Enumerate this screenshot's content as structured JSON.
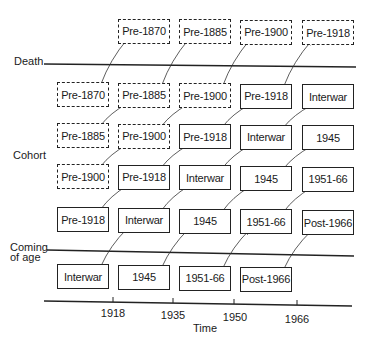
{
  "diagram": {
    "title": "",
    "labels": {
      "death": "Death",
      "cohort": "Cohort",
      "coming_of_age_line1": "Coming",
      "coming_of_age_line2": "of age",
      "time": "Time"
    },
    "axis_ticks": [
      "1918",
      "1935",
      "1950",
      "1966"
    ],
    "rows": [
      {
        "boxes": [
          {
            "col": 1,
            "text": "Pre-1870",
            "style": "dashed"
          },
          {
            "col": 2,
            "text": "Pre-1885",
            "style": "dashed"
          },
          {
            "col": 3,
            "text": "Pre-1900",
            "style": "dashed"
          },
          {
            "col": 4,
            "text": "Pre-1918",
            "style": "dashed"
          }
        ]
      },
      {
        "boxes": [
          {
            "col": 0,
            "text": "Pre-1870",
            "style": "dashed"
          },
          {
            "col": 1,
            "text": "Pre-1885",
            "style": "dashed"
          },
          {
            "col": 2,
            "text": "Pre-1900",
            "style": "dashed"
          },
          {
            "col": 3,
            "text": "Pre-1918",
            "style": "solid"
          },
          {
            "col": 4,
            "text": "Interwar",
            "style": "solid"
          }
        ]
      },
      {
        "boxes": [
          {
            "col": 0,
            "text": "Pre-1885",
            "style": "dashed"
          },
          {
            "col": 1,
            "text": "Pre-1900",
            "style": "dashed"
          },
          {
            "col": 2,
            "text": "Pre-1918",
            "style": "solid"
          },
          {
            "col": 3,
            "text": "Interwar",
            "style": "solid"
          },
          {
            "col": 4,
            "text": "1945",
            "style": "solid"
          }
        ]
      },
      {
        "boxes": [
          {
            "col": 0,
            "text": "Pre-1900",
            "style": "dashed"
          },
          {
            "col": 1,
            "text": "Pre-1918",
            "style": "solid"
          },
          {
            "col": 2,
            "text": "Interwar",
            "style": "solid"
          },
          {
            "col": 3,
            "text": "1945",
            "style": "solid"
          },
          {
            "col": 4,
            "text": "1951-66",
            "style": "solid"
          }
        ]
      },
      {
        "boxes": [
          {
            "col": 0,
            "text": "Pre-1918",
            "style": "solid"
          },
          {
            "col": 1,
            "text": "Interwar",
            "style": "solid"
          },
          {
            "col": 2,
            "text": "1945",
            "style": "solid"
          },
          {
            "col": 3,
            "text": "1951-66",
            "style": "solid"
          },
          {
            "col": 4,
            "text": "Post-1966",
            "style": "solid"
          }
        ]
      },
      {
        "boxes": [
          {
            "col": 0,
            "text": "Interwar",
            "style": "solid"
          },
          {
            "col": 1,
            "text": "1945",
            "style": "solid"
          },
          {
            "col": 2,
            "text": "1951-66",
            "style": "solid"
          },
          {
            "col": 3,
            "text": "Post-1966",
            "style": "solid"
          }
        ]
      }
    ],
    "colors": {
      "ink": "#222222",
      "background": "#ffffff"
    }
  }
}
